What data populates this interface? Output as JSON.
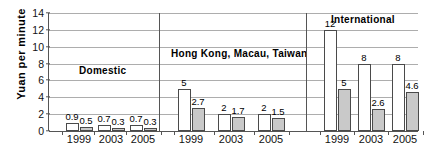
{
  "chart_data": {
    "type": "bar",
    "title": "",
    "subtitle": "",
    "xlabel": "",
    "ylabel": "Yuan per minute",
    "ylim": [
      0,
      14
    ],
    "ytick_step": 2,
    "yticks": [
      "0",
      "2",
      "4",
      "6",
      "8",
      "10",
      "12",
      "14"
    ],
    "grid": true,
    "legend": "none",
    "categories": [
      "1999",
      "2003",
      "2005"
    ],
    "panels": [
      {
        "caption": "Domestic",
        "categories": [
          "1999",
          "2003",
          "2005"
        ],
        "series": [
          {
            "name": "series-a",
            "values": [
              0.9,
              0.7,
              0.7
            ],
            "labels": [
              "0.9",
              "0.7",
              "0.7"
            ]
          },
          {
            "name": "series-b",
            "values": [
              0.5,
              0.3,
              0.3
            ],
            "labels": [
              "0.5",
              "0.3",
              "0.3"
            ]
          }
        ]
      },
      {
        "caption": "Hong Kong, Macau, Taiwan",
        "categories": [
          "1999",
          "2003",
          "2005"
        ],
        "series": [
          {
            "name": "series-a",
            "values": [
              5,
              2,
              2
            ],
            "labels": [
              "5",
              "2",
              "2"
            ]
          },
          {
            "name": "series-b",
            "values": [
              2.7,
              1.7,
              1.5
            ],
            "labels": [
              "2.7",
              "1.7",
              "1.5"
            ]
          }
        ]
      },
      {
        "caption": "International",
        "categories": [
          "1999",
          "2003",
          "2005"
        ],
        "series": [
          {
            "name": "series-a",
            "values": [
              12,
              8,
              8
            ],
            "labels": [
              "12",
              "8",
              "8"
            ]
          },
          {
            "name": "series-b",
            "values": [
              5,
              2.6,
              4.6
            ],
            "labels": [
              "5",
              "2.6",
              "4.6"
            ]
          }
        ]
      }
    ],
    "colors": {
      "series_a_fill": "#ffffff",
      "series_b_fill": "#c9c9c9",
      "bar_stroke": "#4a4a4a",
      "gridline": "#adadad",
      "axis": "#555555",
      "text": "#000000",
      "background": "#ffffff"
    }
  }
}
